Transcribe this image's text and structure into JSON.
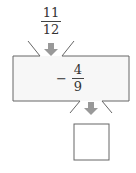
{
  "input": {
    "numerator": "11",
    "denominator": "12"
  },
  "operation": {
    "sign": "−",
    "numerator": "4",
    "denominator": "9"
  },
  "output": {
    "value": ""
  },
  "colors": {
    "arrow": "#999999",
    "border": "#666666",
    "box_fill": "#f7f7f7"
  }
}
